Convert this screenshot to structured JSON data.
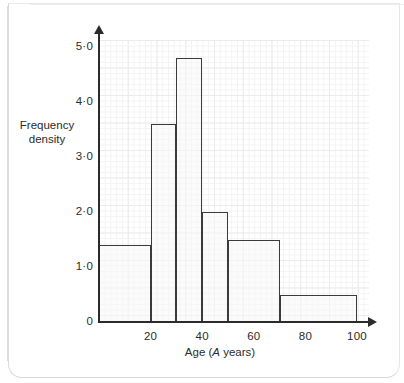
{
  "chart_data": {
    "type": "bar",
    "title": "",
    "subtitle": "",
    "xlabel_prefix": "Age (",
    "xlabel_variable": "A",
    "xlabel_suffix": " years)",
    "xlabel": "Age (A years)",
    "ylabel_line1": "Frequency",
    "ylabel_line2": "density",
    "ylabel": "Frequency density",
    "xlim": [
      0,
      100
    ],
    "ylim": [
      0,
      5.2
    ],
    "grid": true,
    "legend": "none",
    "x_tick_labels": [
      "20",
      "40",
      "60",
      "80",
      "100"
    ],
    "x_tick_values": [
      20,
      40,
      60,
      80,
      100
    ],
    "y_tick_labels": [
      "5·0",
      "4·0",
      "3·0",
      "2·0",
      "1·0",
      "0"
    ],
    "y_tick_values": [
      5.0,
      4.0,
      3.0,
      2.0,
      1.0,
      0
    ],
    "bins": [
      {
        "label": "0 ≤ A < 20",
        "start": 0,
        "end": 20,
        "frequency_density": 1.4
      },
      {
        "label": "20 ≤ A < 30",
        "start": 20,
        "end": 30,
        "frequency_density": 3.6
      },
      {
        "label": "30 ≤ A < 40",
        "start": 30,
        "end": 40,
        "frequency_density": 4.8
      },
      {
        "label": "40 ≤ A < 50",
        "start": 40,
        "end": 50,
        "frequency_density": 2.0
      },
      {
        "label": "50 ≤ A < 70",
        "start": 50,
        "end": 70,
        "frequency_density": 1.5
      },
      {
        "label": "70 ≤ A < 100",
        "start": 70,
        "end": 100,
        "frequency_density": 0.5
      }
    ],
    "colors": {
      "bar_fill": "#f7f7f7",
      "bar_stroke": "#3a3a3a",
      "axis": "#2b2b2b",
      "grid_major": "#ebebeb",
      "grid_minor": "#f3f3f3",
      "text": "#2b2b2b"
    }
  }
}
